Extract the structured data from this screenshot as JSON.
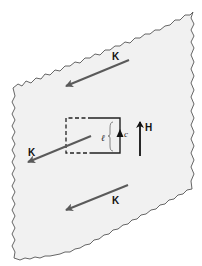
{
  "diagram": {
    "colors": {
      "sheet_fill": "#f1f1f1",
      "sheet_edge": "#555555",
      "k_arrow": "#5a5a5a",
      "loop": "#222222",
      "h_arrow": "#111111"
    },
    "labels": {
      "k_top": "K",
      "k_middle": "K",
      "k_bottom": "K",
      "h_field": "H",
      "loop_length": "ℓ",
      "loop_contour": "c"
    }
  }
}
